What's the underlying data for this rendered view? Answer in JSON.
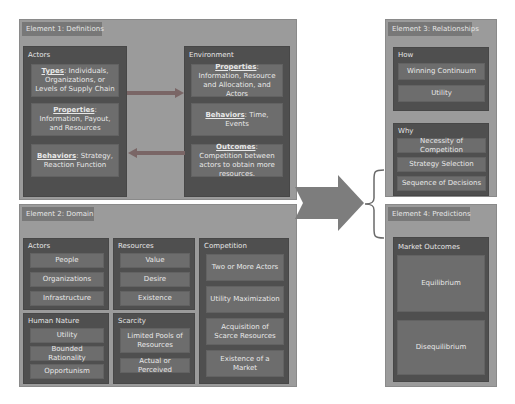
{
  "element1": {
    "title": "Element 1: Definitions",
    "actors": {
      "title": "Actors",
      "items": [
        {
          "key": "Types",
          "text": ": Individuals, Organizations, or Levels of Supply Chain"
        },
        {
          "key": "Properties",
          "text": ": Information, Payout, and Resources"
        },
        {
          "key": "Behaviors",
          "text": ": Strategy, Reaction Function"
        }
      ]
    },
    "environment": {
      "title": "Environment",
      "items": [
        {
          "key": "Properties",
          "text": ": Information, Resource and Allocation, and Actors"
        },
        {
          "key": "Behaviors",
          "text": ": Time, Events"
        },
        {
          "key": "Outcomes",
          "text": ": Competition between actors to obtain more resources."
        }
      ]
    }
  },
  "element2": {
    "title": "Element 2: Domain",
    "actors": {
      "title": "Actors",
      "items": [
        "People",
        "Organizations",
        "Infrastructure"
      ]
    },
    "resources": {
      "title": "Resources",
      "items": [
        "Value",
        "Desire",
        "Existence"
      ]
    },
    "competition": {
      "title": "Competition",
      "items": [
        "Two or More Actors",
        "Utility Maximization",
        "Acquisition of Scarce Resources",
        "Existence of a Market"
      ]
    },
    "human_nature": {
      "title": "Human Nature",
      "items": [
        "Utility",
        "Bounded Rationality",
        "Opportunism"
      ]
    },
    "scarcity": {
      "title": "Scarcity",
      "items": [
        "Limited Pools of Resources",
        "Actual or Perceived"
      ]
    }
  },
  "element3": {
    "title": "Element 3: Relationships",
    "how": {
      "title": "How",
      "items": [
        "Winning Continuum",
        "Utility"
      ]
    },
    "why": {
      "title": "Why",
      "items": [
        "Necessity of Competition",
        "Strategy Selection",
        "Sequence of Decisions"
      ]
    }
  },
  "element4": {
    "title": "Element 4: Predictions",
    "market": {
      "title": "Market Outcomes",
      "items": [
        "Equilibrium",
        "Disequilibrium"
      ]
    }
  },
  "colors": {
    "panel": "#9b9b9b",
    "tab": "#787878",
    "group": "#4f4f4f",
    "item": "#6d6d6d",
    "arrow": "#7d7d7d",
    "text": "#e8e8e8"
  }
}
